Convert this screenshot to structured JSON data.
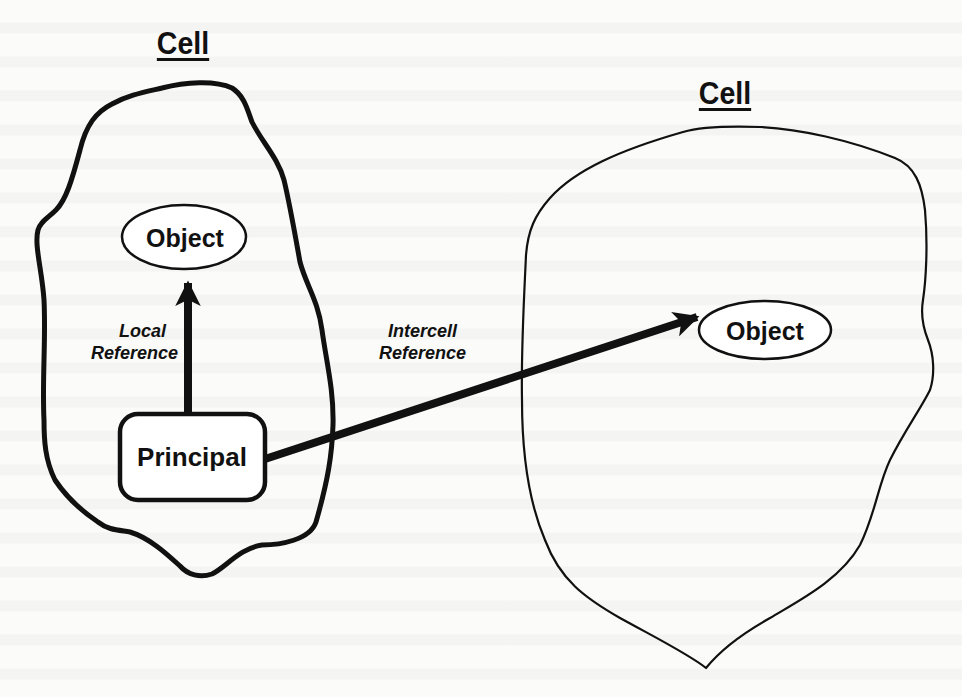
{
  "diagram": {
    "left_cell": {
      "title": "Cell",
      "object_label": "Object",
      "principal_label": "Principal",
      "local_reference_line1": "Local",
      "local_reference_line2": "Reference"
    },
    "right_cell": {
      "title": "Cell",
      "object_label": "Object"
    },
    "intercell_reference_line1": "Intercell",
    "intercell_reference_line2": "Reference",
    "colors": {
      "ink": "#111111",
      "paper": "#fbfbfa"
    }
  }
}
